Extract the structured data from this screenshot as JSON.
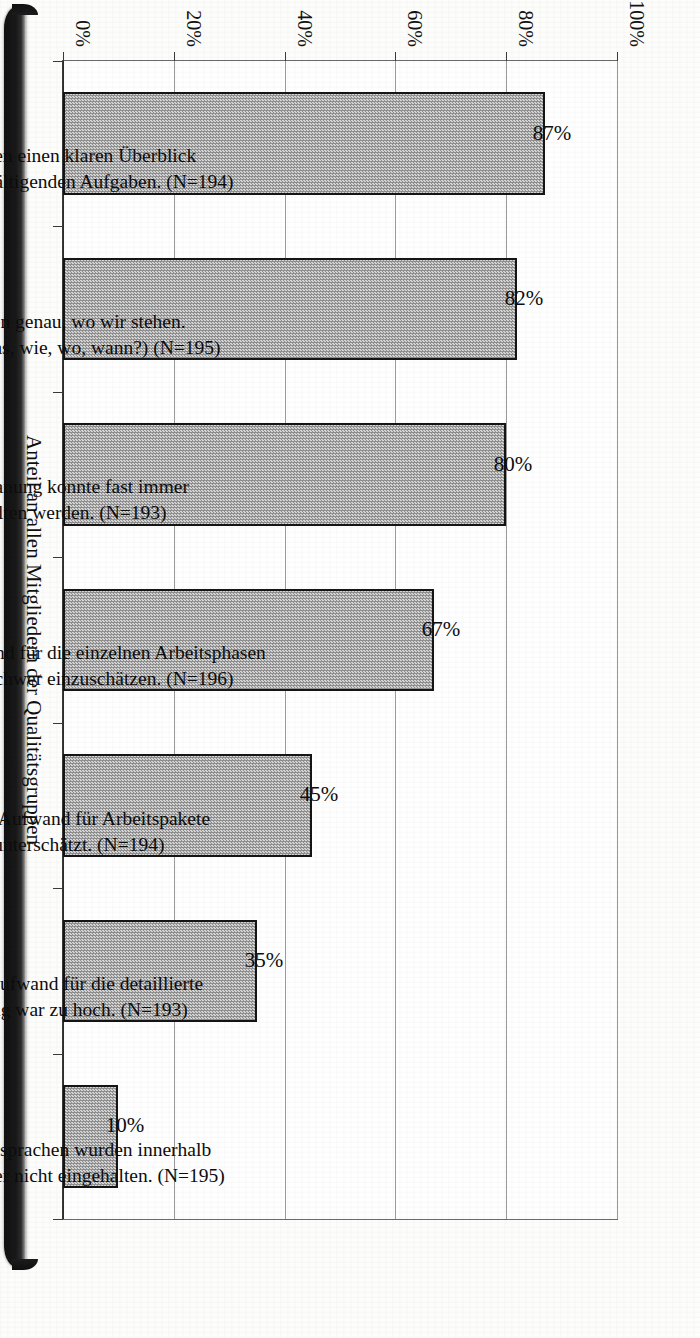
{
  "chart_data": {
    "type": "bar",
    "title": "",
    "subtitle": "",
    "xlabel": "",
    "ylabel": "Anteil an allen Mitgliedern der Qualitätsgruppen",
    "ylim": [
      0,
      100
    ],
    "ytick_labels": [
      "0%",
      "20%",
      "40%",
      "60%",
      "80%",
      "100%"
    ],
    "ytick_values": [
      0,
      20,
      40,
      60,
      80,
      100
    ],
    "grid": true,
    "legend": null,
    "orientation": "vertical-bars-on-rotated-page",
    "categories": [
      "Wir bekamen einen klaren Überblick über die zu bewältigenden Aufgaben. (N=194)",
      "Wir wußten genau, wo wir stehen. (Wer macht was, wie, wo, wann?) (N=195)",
      "Die Zeitplanung konnte fast immer eingehalten werden. (N=193)",
      "Der zeitliche Aufwand für die einzelnen Arbeitsphasen war im voraus schwer einzuschätzen. (N=196)",
      "Der zeitliche Aufwand für Arbeitspakete wurde unterschätzt. (N=194)",
      "Der Arbeitsaufwand für die detaillierte Zeitplanung war zu hoch. (N=193)",
      "Die Terminabsprachen wurden innerhalb der Gruppe öfter nicht eingehalten. (N=195)"
    ],
    "category_lines": [
      [
        "Wir bekamen einen klaren Überblick",
        "über die zu bewältigenden Aufgaben. (N=194)"
      ],
      [
        "Wir wußten genau, wo wir stehen.",
        "(Wer macht was, wie, wo, wann?) (N=195)"
      ],
      [
        "Die Zeitplanung konnte fast immer",
        "eingehalten werden. (N=193)"
      ],
      [
        "Der zeitliche Aufwand für die einzelnen Arbeitsphasen",
        "war im voraus schwer einzuschätzen. (N=196)"
      ],
      [
        "Der zeitliche Aufwand für Arbeitspakete",
        "wurde unterschätzt. (N=194)"
      ],
      [
        "Der Arbeitsaufwand für die detaillierte",
        "Zeitplanung war zu hoch. (N=193)"
      ],
      [
        "Die Terminabsprachen wurden innerhalb",
        "der Gruppe öfter nicht eingehalten. (N=195)"
      ]
    ],
    "values": [
      87,
      82,
      80,
      67,
      45,
      35,
      10
    ],
    "value_labels": [
      "87%",
      "82%",
      "80%",
      "67%",
      "45%",
      "35%",
      "10%"
    ],
    "colors": {
      "bar_fill": "#b9b9b9",
      "bar_border": "#151515",
      "gridline": "#9b9b9b",
      "axis": "#3a3a3a",
      "text": "#0d0d0d",
      "background": "#ffffff"
    }
  }
}
